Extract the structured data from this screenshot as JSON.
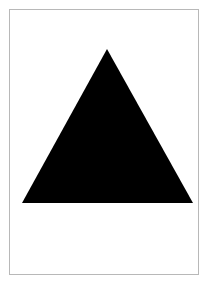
{
  "canvas": {
    "width": 208,
    "height": 286,
    "background": "#ffffff"
  },
  "frame": {
    "border_color": "#b8b8b8"
  },
  "shape": {
    "type": "triangle",
    "fill": "#000000",
    "points": "107,49 22,203 193,203"
  },
  "caption": {
    "text": ""
  }
}
